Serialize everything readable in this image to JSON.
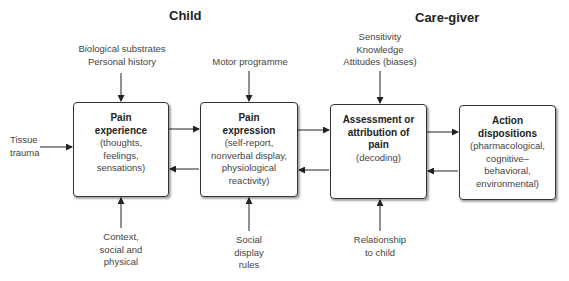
{
  "sections": {
    "child": "Child",
    "caregiver": "Care-giver"
  },
  "boxes": [
    {
      "title_lines": [
        "Pain",
        "experience"
      ],
      "desc_lines": [
        "(thoughts,",
        "feelings,",
        "sensations)"
      ]
    },
    {
      "title_lines": [
        "Pain",
        "expression"
      ],
      "desc_lines": [
        "(self-report,",
        "nonverbal display,",
        "physiological",
        "reactivity)"
      ]
    },
    {
      "title_lines": [
        "Assessment or",
        "attribution of",
        "pain"
      ],
      "desc_lines": [
        "(decoding)"
      ]
    },
    {
      "title_lines": [
        "Action",
        "dispositions"
      ],
      "desc_lines": [
        "(pharmacological,",
        "cognitive–",
        "behavioral,",
        "environmental)"
      ]
    }
  ],
  "inputs": {
    "left": [
      "Tissue",
      "trauma"
    ],
    "top": [
      [
        "Biological substrates",
        "Personal history"
      ],
      [
        "Motor programme"
      ],
      [
        "Sensitivity",
        "Knowledge",
        "Attitudes (biases)"
      ]
    ],
    "bottom": [
      [
        "Context,",
        "social and",
        "physical"
      ],
      [
        "Social",
        "display",
        "rules"
      ],
      [
        "Relationship",
        "to child"
      ]
    ]
  },
  "colors": {
    "line": "#222222",
    "text": "#444444",
    "box_border": "#333333"
  }
}
